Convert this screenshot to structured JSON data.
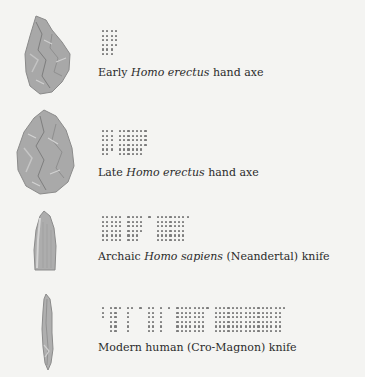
{
  "figure": {
    "background": "#f4f4f2",
    "dot_color": "#7c7c7c",
    "tool_color": "#a9a9a9",
    "rows": [
      {
        "id": "early-homo-erectus",
        "caption": {
          "pre": "Early ",
          "italic": "Homo erectus",
          "post": " hand axe"
        },
        "tool": "hand-axe-small",
        "blocks": [
          {
            "cols": 4,
            "row_counts": [
              4,
              4,
              4,
              4,
              3,
              3
            ]
          }
        ]
      },
      {
        "id": "late-homo-erectus",
        "caption": {
          "pre": "Late ",
          "italic": "Homo erectus",
          "post": " hand axe"
        },
        "tool": "hand-axe-large",
        "blocks": [
          {
            "cols": 3,
            "row_counts": [
              3,
              3,
              3,
              3,
              3,
              2
            ]
          },
          {
            "cols": 7,
            "row_counts": [
              7,
              7,
              7,
              7,
              6,
              6
            ]
          }
        ]
      },
      {
        "id": "archaic-homo-sapiens",
        "caption": {
          "pre": "Archaic ",
          "italic": "Homo sapiens",
          "post": " (Neandertal) knife"
        },
        "tool": "neandertal-knife",
        "blocks": [
          {
            "cols": 5,
            "row_counts": [
              5,
              5,
              5,
              5,
              5,
              5
            ]
          },
          {
            "cols": 4,
            "row_counts": [
              4,
              4,
              4,
              4,
              3,
              3
            ]
          },
          {
            "cols": 1,
            "row_counts": [
              1
            ]
          },
          {
            "cols": 8,
            "row_counts": [
              8,
              7,
              7,
              7,
              7,
              7
            ]
          }
        ]
      },
      {
        "id": "modern-human-cro-magnon",
        "caption": {
          "pre": "Modern human (Cro-Magnon) knife",
          "italic": "",
          "post": ""
        },
        "tool": "cro-magnon-blade",
        "blocks": [
          {
            "cols": 1,
            "row_counts": [
              1,
              1,
              1
            ]
          },
          {
            "cols": 3,
            "row_counts": [
              3,
              2,
              2,
              2,
              2,
              2
            ]
          },
          {
            "cols": 2,
            "row_counts": [
              2,
              1,
              1,
              1,
              1,
              1
            ]
          },
          {
            "cols": 1,
            "row_counts": [
              1
            ]
          },
          {
            "cols": 2,
            "row_counts": [
              2,
              2,
              2,
              2,
              2,
              2
            ]
          },
          {
            "cols": 1,
            "row_counts": [
              1,
              1,
              1,
              1,
              1,
              1
            ]
          },
          {
            "cols": 1,
            "row_counts": [
              1
            ]
          },
          {
            "cols": 8,
            "row_counts": [
              8,
              7,
              7,
              7,
              7,
              7
            ]
          },
          {
            "cols": 17,
            "row_counts": [
              17,
              16,
              16,
              16,
              16,
              16
            ]
          }
        ]
      }
    ]
  }
}
